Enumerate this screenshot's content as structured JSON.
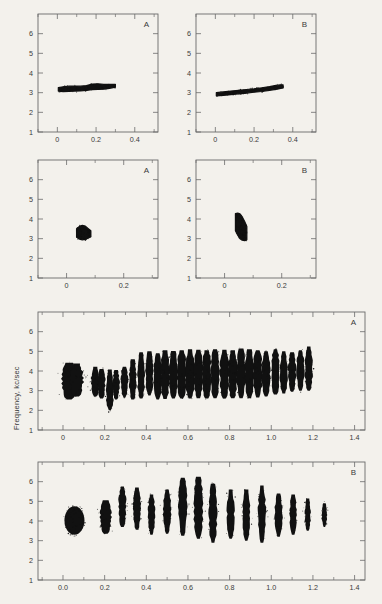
{
  "figure": {
    "background_color": "#f3f1ec",
    "ink_color": "#111111",
    "axis_color": "#6b6b6b",
    "y_axis_label": "Frequency, kc/sec",
    "x_axis_label": "Time, seconds"
  },
  "chart_data": [
    {
      "id": "panel-1a",
      "type": "scatter",
      "title": "",
      "panel_letter": "A",
      "xlabel": "",
      "ylabel": "",
      "xlim": [
        -0.1,
        0.52
      ],
      "ylim": [
        1,
        7
      ],
      "xticks": [
        0,
        0.2,
        0.4
      ],
      "xtick_labels": [
        "0",
        "0.2",
        "0.4"
      ],
      "xminor": [
        -0.1,
        0.1,
        0.3,
        0.5
      ],
      "yticks": [
        1,
        2,
        3,
        4,
        5,
        6
      ],
      "ytick_labels": [
        "1",
        "2",
        "3",
        "4",
        "5",
        "6"
      ],
      "grid": false,
      "legend": "none",
      "description": "single near-horizontal band, slowly rising",
      "trace": [
        {
          "t": 0.005,
          "f_lo": 3.08,
          "f_hi": 3.26
        },
        {
          "t": 0.03,
          "f_lo": 3.05,
          "f_hi": 3.3
        },
        {
          "t": 0.06,
          "f_lo": 3.07,
          "f_hi": 3.33
        },
        {
          "t": 0.09,
          "f_lo": 3.08,
          "f_hi": 3.34
        },
        {
          "t": 0.12,
          "f_lo": 3.09,
          "f_hi": 3.33
        },
        {
          "t": 0.15,
          "f_lo": 3.12,
          "f_hi": 3.36
        },
        {
          "t": 0.18,
          "f_lo": 3.15,
          "f_hi": 3.44
        },
        {
          "t": 0.21,
          "f_lo": 3.16,
          "f_hi": 3.45
        },
        {
          "t": 0.24,
          "f_lo": 3.18,
          "f_hi": 3.42
        },
        {
          "t": 0.27,
          "f_lo": 3.22,
          "f_hi": 3.42
        },
        {
          "t": 0.3,
          "f_lo": 3.28,
          "f_hi": 3.42
        }
      ]
    },
    {
      "id": "panel-1b",
      "type": "scatter",
      "title": "",
      "panel_letter": "B",
      "xlabel": "",
      "ylabel": "",
      "xlim": [
        -0.1,
        0.52
      ],
      "ylim": [
        1,
        7
      ],
      "xticks": [
        0,
        0.2,
        0.4
      ],
      "xtick_labels": [
        "0",
        "0.2",
        "0.4"
      ],
      "xminor": [
        -0.1,
        0.1,
        0.3,
        0.5
      ],
      "yticks": [
        1,
        2,
        3,
        4,
        5,
        6
      ],
      "ytick_labels": [
        "1",
        "2",
        "3",
        "4",
        "5",
        "6"
      ],
      "grid": false,
      "legend": "none",
      "description": "single rising band from 2.9 to 3.4 kc/sec",
      "trace": [
        {
          "t": 0.005,
          "f_lo": 2.84,
          "f_hi": 3.0
        },
        {
          "t": 0.04,
          "f_lo": 2.86,
          "f_hi": 3.04
        },
        {
          "t": 0.08,
          "f_lo": 2.9,
          "f_hi": 3.08
        },
        {
          "t": 0.12,
          "f_lo": 2.94,
          "f_hi": 3.12
        },
        {
          "t": 0.16,
          "f_lo": 2.98,
          "f_hi": 3.16
        },
        {
          "t": 0.2,
          "f_lo": 3.02,
          "f_hi": 3.2
        },
        {
          "t": 0.24,
          "f_lo": 3.06,
          "f_hi": 3.25
        },
        {
          "t": 0.28,
          "f_lo": 3.12,
          "f_hi": 3.31
        },
        {
          "t": 0.32,
          "f_lo": 3.18,
          "f_hi": 3.38
        },
        {
          "t": 0.35,
          "f_lo": 3.24,
          "f_hi": 3.4
        }
      ]
    },
    {
      "id": "panel-2a",
      "type": "scatter",
      "title": "",
      "panel_letter": "A",
      "xlabel": "",
      "ylabel": "",
      "xlim": [
        -0.1,
        0.32
      ],
      "ylim": [
        1,
        7
      ],
      "xticks": [
        0,
        0.2
      ],
      "xtick_labels": [
        "0",
        "0.2"
      ],
      "xminor": [
        -0.1,
        0.1,
        0.3
      ],
      "yticks": [
        1,
        2,
        3,
        4,
        5,
        6
      ],
      "ytick_labels": [
        "1",
        "2",
        "3",
        "4",
        "5",
        "6"
      ],
      "grid": false,
      "legend": "none",
      "description": "compact round blob centered near 0.055 s, 3.3 kc/sec",
      "trace": [
        {
          "t": 0.035,
          "f_lo": 3.08,
          "f_hi": 3.5
        },
        {
          "t": 0.045,
          "f_lo": 2.98,
          "f_hi": 3.62
        },
        {
          "t": 0.055,
          "f_lo": 2.94,
          "f_hi": 3.68
        },
        {
          "t": 0.065,
          "f_lo": 2.96,
          "f_hi": 3.64
        },
        {
          "t": 0.075,
          "f_lo": 3.02,
          "f_hi": 3.52
        },
        {
          "t": 0.085,
          "f_lo": 3.1,
          "f_hi": 3.4
        }
      ]
    },
    {
      "id": "panel-2b",
      "type": "scatter",
      "title": "",
      "panel_letter": "B",
      "xlabel": "",
      "ylabel": "",
      "xlim": [
        -0.1,
        0.32
      ],
      "ylim": [
        1,
        7
      ],
      "xticks": [
        0,
        0.2
      ],
      "xtick_labels": [
        "0",
        "0.2"
      ],
      "xminor": [
        -0.1,
        0.1,
        0.3
      ],
      "yticks": [
        1,
        2,
        3,
        4,
        5,
        6
      ],
      "ytick_labels": [
        "1",
        "2",
        "3",
        "4",
        "5",
        "6"
      ],
      "grid": false,
      "legend": "none",
      "description": "narrow vertical comb blob spanning 2.9 to 4.3 kc/sec near 0.055 s",
      "trace": [
        {
          "t": 0.038,
          "f_lo": 3.4,
          "f_hi": 4.28
        },
        {
          "t": 0.046,
          "f_lo": 3.18,
          "f_hi": 4.3
        },
        {
          "t": 0.054,
          "f_lo": 3.0,
          "f_hi": 4.26
        },
        {
          "t": 0.062,
          "f_lo": 2.92,
          "f_hi": 4.1
        },
        {
          "t": 0.07,
          "f_lo": 2.9,
          "f_hi": 3.88
        },
        {
          "t": 0.078,
          "f_lo": 2.94,
          "f_hi": 3.62
        }
      ]
    },
    {
      "id": "panel-3a",
      "type": "scatter",
      "title": "",
      "panel_letter": "A",
      "xlabel": "",
      "ylabel": "",
      "xlim": [
        -0.12,
        1.45
      ],
      "ylim": [
        1,
        7
      ],
      "xticks": [
        0,
        0.2,
        0.4,
        0.6,
        0.8,
        1.0,
        1.2,
        1.4
      ],
      "xtick_labels": [
        "0",
        "0.2",
        "0.4",
        "0.6",
        "0.8",
        "1.0",
        "1.2",
        "1.4"
      ],
      "xminor": [
        -0.1,
        0.1,
        0.3,
        0.5,
        0.7,
        0.9,
        1.1,
        1.3
      ],
      "yticks": [
        1,
        2,
        3,
        4,
        5,
        6
      ],
      "ytick_labels": [
        "1",
        "2",
        "3",
        "4",
        "5",
        "6"
      ],
      "grid": false,
      "legend": "none",
      "description": "long trill: initial blob then ~24 vertical pulses rising in frequency from 3 to 5 kc/sec",
      "pulses": [
        {
          "t": 0.03,
          "f_lo": 2.55,
          "f_hi": 4.42,
          "w": 0.035
        },
        {
          "t": 0.065,
          "f_lo": 2.7,
          "f_hi": 4.38,
          "w": 0.032
        },
        {
          "t": 0.155,
          "f_lo": 2.7,
          "f_hi": 4.22,
          "w": 0.02
        },
        {
          "t": 0.185,
          "f_lo": 2.6,
          "f_hi": 4.1,
          "w": 0.018
        },
        {
          "t": 0.225,
          "f_lo": 2.0,
          "f_hi": 4.08,
          "w": 0.018
        },
        {
          "t": 0.255,
          "f_lo": 2.55,
          "f_hi": 4.05,
          "w": 0.016
        },
        {
          "t": 0.295,
          "f_lo": 2.65,
          "f_hi": 4.22,
          "w": 0.016
        },
        {
          "t": 0.335,
          "f_lo": 2.55,
          "f_hi": 4.6,
          "w": 0.018
        },
        {
          "t": 0.375,
          "f_lo": 2.6,
          "f_hi": 4.95,
          "w": 0.018
        },
        {
          "t": 0.415,
          "f_lo": 2.75,
          "f_hi": 5.0,
          "w": 0.018
        },
        {
          "t": 0.455,
          "f_lo": 2.55,
          "f_hi": 4.9,
          "w": 0.02
        },
        {
          "t": 0.49,
          "f_lo": 2.58,
          "f_hi": 5.05,
          "w": 0.022
        },
        {
          "t": 0.53,
          "f_lo": 2.6,
          "f_hi": 5.02,
          "w": 0.022
        },
        {
          "t": 0.57,
          "f_lo": 2.6,
          "f_hi": 5.05,
          "w": 0.022
        },
        {
          "t": 0.61,
          "f_lo": 2.6,
          "f_hi": 5.1,
          "w": 0.022
        },
        {
          "t": 0.65,
          "f_lo": 2.62,
          "f_hi": 5.08,
          "w": 0.022
        },
        {
          "t": 0.69,
          "f_lo": 2.6,
          "f_hi": 5.05,
          "w": 0.022
        },
        {
          "t": 0.73,
          "f_lo": 2.62,
          "f_hi": 5.1,
          "w": 0.022
        },
        {
          "t": 0.775,
          "f_lo": 2.6,
          "f_hi": 5.08,
          "w": 0.022
        },
        {
          "t": 0.815,
          "f_lo": 2.62,
          "f_hi": 5.05,
          "w": 0.022
        },
        {
          "t": 0.855,
          "f_lo": 2.62,
          "f_hi": 5.15,
          "w": 0.022
        },
        {
          "t": 0.895,
          "f_lo": 2.62,
          "f_hi": 5.1,
          "w": 0.022
        },
        {
          "t": 0.935,
          "f_lo": 2.65,
          "f_hi": 5.05,
          "w": 0.022
        },
        {
          "t": 0.975,
          "f_lo": 2.7,
          "f_hi": 5.0,
          "w": 0.02
        },
        {
          "t": 1.02,
          "f_lo": 2.8,
          "f_hi": 5.1,
          "w": 0.02
        },
        {
          "t": 1.06,
          "f_lo": 2.85,
          "f_hi": 5.0,
          "w": 0.018
        },
        {
          "t": 1.1,
          "f_lo": 2.95,
          "f_hi": 4.95,
          "w": 0.018
        },
        {
          "t": 1.14,
          "f_lo": 3.0,
          "f_hi": 5.05,
          "w": 0.018
        },
        {
          "t": 1.18,
          "f_lo": 3.0,
          "f_hi": 5.25,
          "w": 0.018
        }
      ]
    },
    {
      "id": "panel-3b",
      "type": "scatter",
      "title": "",
      "panel_letter": "B",
      "xlabel": "Time, seconds",
      "ylabel": "",
      "xlim": [
        -0.12,
        1.45
      ],
      "ylim": [
        1,
        7
      ],
      "xticks": [
        0,
        0.2,
        0.4,
        0.6,
        0.8,
        1.0,
        1.2,
        1.4
      ],
      "xtick_labels": [
        "0.0",
        "0.2",
        "0.4",
        "0.6",
        "0.8",
        "1.0",
        "1.2",
        "1.4"
      ],
      "xminor": [
        -0.1,
        0.1,
        0.3,
        0.5,
        0.7,
        0.9,
        1.1,
        1.3
      ],
      "yticks": [
        1,
        2,
        3,
        4,
        5,
        6
      ],
      "ytick_labels": [
        "1",
        "2",
        "3",
        "4",
        "5",
        "6"
      ],
      "grid": false,
      "legend": "none",
      "description": "oval introductory note then ~16 separated vertical pulses arching to 6.2 kc/sec near 0.65 s",
      "pulses": [
        {
          "t": 0.055,
          "f_lo": 3.3,
          "f_hi": 4.75,
          "w": 0.048,
          "shape": "oval"
        },
        {
          "t": 0.205,
          "f_lo": 3.35,
          "f_hi": 5.05,
          "w": 0.026
        },
        {
          "t": 0.285,
          "f_lo": 3.7,
          "f_hi": 5.75,
          "w": 0.018
        },
        {
          "t": 0.355,
          "f_lo": 3.55,
          "f_hi": 5.7,
          "w": 0.018
        },
        {
          "t": 0.425,
          "f_lo": 3.3,
          "f_hi": 5.35,
          "w": 0.016
        },
        {
          "t": 0.5,
          "f_lo": 3.35,
          "f_hi": 5.6,
          "w": 0.018
        },
        {
          "t": 0.575,
          "f_lo": 3.25,
          "f_hi": 6.2,
          "w": 0.02
        },
        {
          "t": 0.65,
          "f_lo": 3.1,
          "f_hi": 6.25,
          "w": 0.022
        },
        {
          "t": 0.72,
          "f_lo": 2.9,
          "f_hi": 5.9,
          "w": 0.02
        },
        {
          "t": 0.805,
          "f_lo": 3.1,
          "f_hi": 5.6,
          "w": 0.018
        },
        {
          "t": 0.88,
          "f_lo": 3.0,
          "f_hi": 5.6,
          "w": 0.018
        },
        {
          "t": 0.955,
          "f_lo": 2.9,
          "f_hi": 5.8,
          "w": 0.018
        },
        {
          "t": 1.035,
          "f_lo": 3.2,
          "f_hi": 5.4,
          "w": 0.018
        },
        {
          "t": 1.105,
          "f_lo": 3.3,
          "f_hi": 5.35,
          "w": 0.016
        },
        {
          "t": 1.175,
          "f_lo": 3.5,
          "f_hi": 5.15,
          "w": 0.014
        },
        {
          "t": 1.255,
          "f_lo": 3.7,
          "f_hi": 4.9,
          "w": 0.012
        }
      ]
    }
  ]
}
